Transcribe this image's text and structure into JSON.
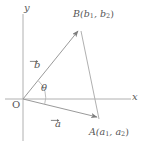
{
  "figure": {
    "background_color": "#ffffff",
    "line_color": "#9a9a9a",
    "text_color": "#555555",
    "width": 152,
    "height": 146
  },
  "axes": {
    "x_label": "x",
    "y_label": "y",
    "origin_label": "O",
    "origin_px": {
      "x": 23,
      "y": 99
    }
  },
  "angle": {
    "label": "θ",
    "between": [
      "a",
      "b"
    ]
  },
  "points": [
    {
      "name": "B",
      "label_text": "B(b",
      "sub1": "1",
      "mid": ", b",
      "sub2": "2",
      "close": ")",
      "px": {
        "x": 79,
        "y": 30
      }
    },
    {
      "name": "A",
      "label_text": "A(a",
      "sub1": "1",
      "mid": ", a",
      "sub2": "2",
      "close": ")",
      "px": {
        "x": 98,
        "y": 118
      }
    }
  ],
  "vectors": [
    {
      "name": "b",
      "label": "b",
      "from": "O",
      "to": "B",
      "arrow_over": true
    },
    {
      "name": "a",
      "label": "a",
      "from": "O",
      "to": "A",
      "arrow_over": true
    }
  ],
  "segments": [
    {
      "name": "BA",
      "from": "B",
      "to": "A"
    }
  ]
}
